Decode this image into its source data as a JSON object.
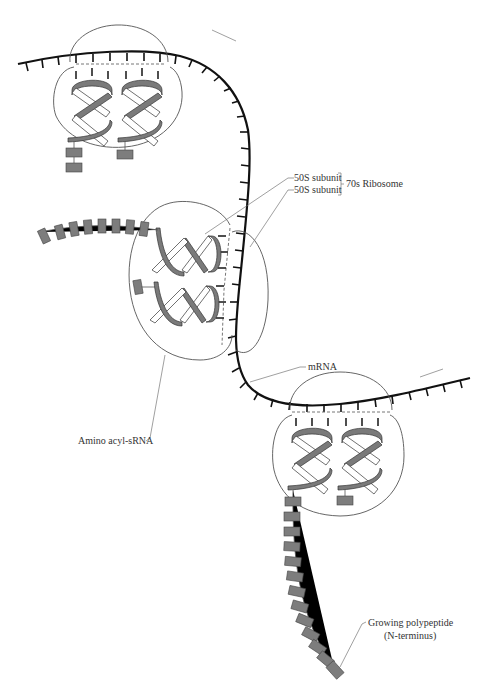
{
  "figure": {
    "header_text": ""
  },
  "labels": {
    "subunit_top": "50S subunit",
    "subunit_bottom": "50S subunit",
    "ribosome": "70s Ribosome",
    "amino_acyl": "Amino acyl-sRNA",
    "mrna": "mRNA",
    "polypeptide_line1": "Growing polypeptide",
    "polypeptide_line2": "(N-terminus)"
  },
  "colors": {
    "ink": "#111111",
    "outline": "#555555",
    "residue": "#7d7d7d",
    "background": "#ffffff"
  },
  "components": {
    "ribosomes": [
      {
        "id": "ribosome-top",
        "position": "upper-left",
        "trna_count": 2
      },
      {
        "id": "ribosome-middle",
        "position": "center-left",
        "trna_count": 2
      },
      {
        "id": "ribosome-bottom",
        "position": "lower-right",
        "trna_count": 2
      }
    ],
    "polypeptide_chains": [
      {
        "id": "chain-top",
        "residues": 2
      },
      {
        "id": "chain-middle",
        "residues": 8
      },
      {
        "id": "chain-bottom",
        "residues": 13
      }
    ]
  }
}
